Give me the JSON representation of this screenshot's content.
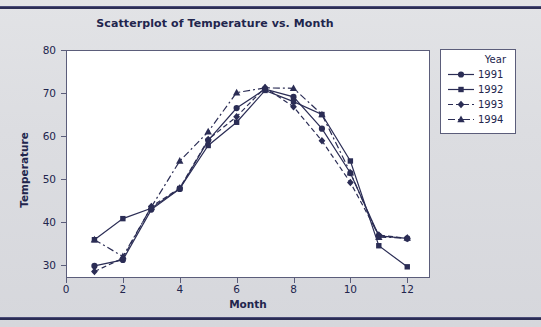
{
  "chart_data": {
    "type": "line",
    "title": "Scatterplot of Temperature vs. Month",
    "xlabel": "Month",
    "ylabel": "Temperature",
    "xlim": [
      0,
      12.8
    ],
    "ylim": [
      27,
      80
    ],
    "xticks": [
      0,
      2,
      4,
      6,
      8,
      10,
      12
    ],
    "yticks": [
      30,
      40,
      50,
      60,
      70,
      80
    ],
    "grid": false,
    "legend_title": "Year",
    "legend_position": "right-outside",
    "x": [
      1,
      2,
      3,
      4,
      5,
      6,
      7,
      8,
      9,
      10,
      11,
      12
    ],
    "series": [
      {
        "name": "1991",
        "marker": "circle",
        "line": "solid",
        "color": "#2b2d55",
        "values": [
          29.8,
          31.2,
          42.9,
          47.7,
          59.0,
          66.5,
          70.9,
          69.1,
          61.7,
          51.4,
          36.8,
          36.2
        ]
      },
      {
        "name": "1992",
        "marker": "square",
        "line": "solid",
        "color": "#2b2d55",
        "values": [
          35.9,
          40.8,
          43.2,
          47.8,
          57.8,
          63.2,
          70.6,
          68.0,
          65.0,
          54.2,
          34.5,
          29.6
        ]
      },
      {
        "name": "1993",
        "marker": "diamond",
        "line": "dashed",
        "color": "#2b2d55",
        "values": [
          28.5,
          31.6,
          43.6,
          47.9,
          59.2,
          64.5,
          71.3,
          66.8,
          58.9,
          49.2,
          37.0,
          36.2
        ]
      },
      {
        "name": "1994",
        "marker": "triangle",
        "line": "dashdot",
        "color": "#2b2d55",
        "values": [
          35.9,
          32.0,
          43.5,
          54.2,
          61.0,
          70.1,
          71.2,
          71.1,
          65.0,
          51.5,
          36.5,
          36.3
        ]
      }
    ]
  },
  "style": {
    "page_background": "#dcdde1",
    "plot_background": "#ffffff",
    "ink": "#22254d",
    "axis": "#5b5d7a",
    "rule": "#2b2d55"
  }
}
